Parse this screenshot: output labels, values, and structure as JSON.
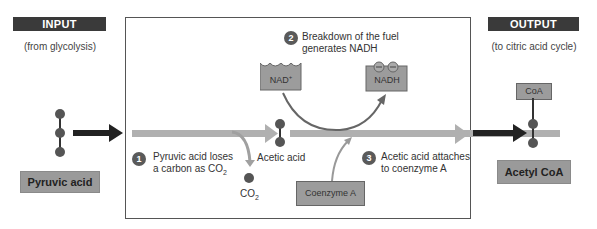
{
  "input": {
    "tag": "INPUT",
    "source": "(from glycolysis)",
    "molecule_label": "Pyruvic acid"
  },
  "output": {
    "tag": "OUTPUT",
    "destination": "(to citric acid cycle)",
    "molecule_label": "Acetyl CoA",
    "coa_label": "CoA"
  },
  "steps": [
    {
      "number": "1",
      "text_line1": "Pyruvic acid loses",
      "text_line2_prefix": "a carbon as CO",
      "text_line2_sub": "2"
    },
    {
      "number": "2",
      "text_line1": "Breakdown of the fuel",
      "text_line2": "generates NADH"
    },
    {
      "number": "3",
      "text_line1": "Acetic acid attaches",
      "text_line2": "to coenzyme A"
    }
  ],
  "molecules": {
    "nad_plus": "NAD",
    "nad_plus_sup": "+",
    "nadh": "NADH",
    "acetic_acid": "Acetic acid",
    "co2_prefix": "CO",
    "co2_sub": "2",
    "coenzyme_a": "Coenzyme A"
  },
  "colors": {
    "tag_bg": "#3a3a3a",
    "box_gray": "#9c9c9c",
    "arrow_light": "#b0b0b0",
    "arrow_dark": "#222222",
    "ball": "#555555"
  }
}
